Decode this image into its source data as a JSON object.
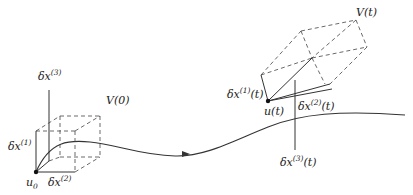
{
  "diagram": {
    "left_frame": {
      "origin_label": "u",
      "origin_sub": "0",
      "volume_label": "V(0)",
      "axis1": {
        "base": "δx",
        "sup": "(1)",
        "suffix": ""
      },
      "axis2": {
        "base": "δx",
        "sup": "(2)",
        "suffix": ""
      },
      "axis3": {
        "base": "δx",
        "sup": "(3)",
        "suffix": ""
      }
    },
    "right_frame": {
      "origin_label": "u(t)",
      "volume_label": "V(t)",
      "axis1": {
        "base": "δx",
        "sup": "(1)",
        "suffix": "(t)"
      },
      "axis2": {
        "base": "δx",
        "sup": "(2)",
        "suffix": "(t)"
      },
      "axis3": {
        "base": "δx",
        "sup": "(3)",
        "suffix": "(t)"
      }
    },
    "trajectory": {
      "arrow": "direction-of-flow"
    },
    "colors": {
      "stroke": "#333333",
      "background": "#ffffff"
    }
  }
}
